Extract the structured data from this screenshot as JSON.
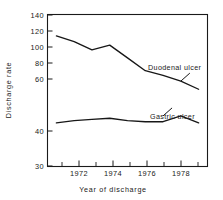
{
  "chart_data": {
    "type": "line",
    "title": "",
    "xlabel": "Year of discharge",
    "ylabel": "Discharge rate",
    "grid": false,
    "legend_position": "inline-annotation",
    "xlim": [
      1970.5,
      1979.5
    ],
    "ylim": [
      30,
      140
    ],
    "x_ticks_major": [
      1972,
      1974,
      1976,
      1978
    ],
    "x_ticks_major_labels": [
      "1972",
      "1974",
      "1976",
      "1978"
    ],
    "x_ticks_minor": [
      1971,
      1973,
      1975,
      1977,
      1979
    ],
    "y_ticks": [
      30,
      40,
      60,
      80,
      100,
      120,
      140
    ],
    "y_tick_labels": [
      "30",
      "40",
      "60",
      "80",
      "100",
      "120",
      "140"
    ],
    "y_axis_note": "compressed segment between 30 and 40",
    "x": [
      1971,
      1972,
      1973,
      1974,
      1975,
      1976,
      1977,
      1978,
      1979
    ],
    "series": [
      {
        "name": "Duodenal ulcer",
        "label": "Duodenal ulcer",
        "values": [
          122,
          117,
          110,
          114,
          103,
          92,
          88,
          83,
          76
        ]
      },
      {
        "name": "Gastric ulcer",
        "label": "Gastric ulcer",
        "values": [
          47,
          49,
          50,
          51,
          49,
          48,
          48,
          53,
          47
        ]
      }
    ],
    "annotations": [
      {
        "text": "Duodenal ulcer",
        "series": "Duodenal ulcer",
        "anchor_x": 1978.0,
        "anchor_y": 83
      },
      {
        "text": "Gastric ulcer",
        "series": "Gastric ulcer",
        "anchor_x": 1977.0,
        "anchor_y": 53
      }
    ],
    "colors": {
      "line": "#171717",
      "axis": "#1a1a1a",
      "background": "#ffffff"
    }
  }
}
